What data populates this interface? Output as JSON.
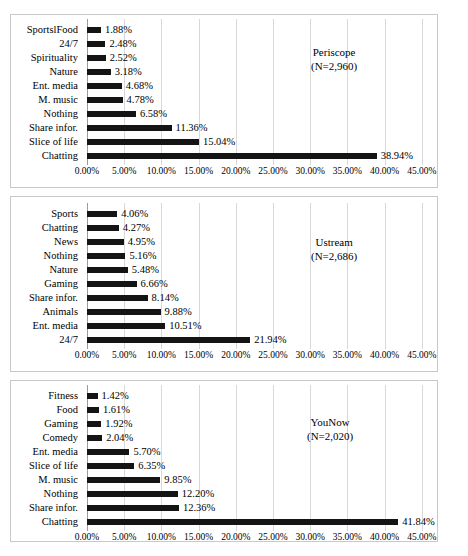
{
  "figure": {
    "background": "#ffffff",
    "frame_color": "#c9c9c9",
    "bar_color": "#141414",
    "gridline_color": "#d8d8d8"
  },
  "chart_data": [
    {
      "type": "bar",
      "orientation": "horizontal",
      "title": "",
      "series_name": "Periscope",
      "sample_size_label": "(N=2,960)",
      "categories": [
        "SportslFood",
        "24/7",
        "Spirituality",
        "Nature",
        "Ent. media",
        "M. music",
        "Nothing",
        "Share infor.",
        "Slice of life",
        "Chatting"
      ],
      "values": [
        1.88,
        2.48,
        2.52,
        3.18,
        4.68,
        4.78,
        6.58,
        11.36,
        15.04,
        38.94
      ],
      "data_labels": [
        "1.88%",
        "2.48%",
        "2.52%",
        "3.18%",
        "4.68%",
        "4.78%",
        "6.58%",
        "11.36%",
        "15.04%",
        "38.94%"
      ],
      "xlabel": "",
      "ylabel": "",
      "xlim": [
        0,
        45
      ],
      "xticks": [
        0,
        5,
        10,
        15,
        20,
        25,
        30,
        35,
        40,
        45
      ],
      "xticklabels": [
        "0.00%",
        "5.00%",
        "10.00%",
        "15.00%",
        "20.00%",
        "25.00%",
        "30.00%",
        "35.00%",
        "40.00%",
        "45.00%"
      ],
      "grid": true,
      "legend": "none"
    },
    {
      "type": "bar",
      "orientation": "horizontal",
      "title": "",
      "series_name": "Ustream",
      "sample_size_label": "(N=2,686)",
      "categories": [
        "Sports",
        "Chatting",
        "News",
        "Nothing",
        "Nature",
        "Gaming",
        "Share infor.",
        "Animals",
        "Ent. media",
        "24/7"
      ],
      "values": [
        4.06,
        4.27,
        4.95,
        5.16,
        5.48,
        6.66,
        8.14,
        9.88,
        10.51,
        21.94
      ],
      "data_labels": [
        "4.06%",
        "4.27%",
        "4.95%",
        "5.16%",
        "5.48%",
        "6.66%",
        "8.14%",
        "9.88%",
        "10.51%",
        "21.94%"
      ],
      "xlabel": "",
      "ylabel": "",
      "xlim": [
        0,
        45
      ],
      "xticks": [
        0,
        5,
        10,
        15,
        20,
        25,
        30,
        35,
        40,
        45
      ],
      "xticklabels": [
        "0.00%",
        "5.00%",
        "10.00%",
        "15.00%",
        "20.00%",
        "25.00%",
        "30.00%",
        "35.00%",
        "40.00%",
        "45.00%"
      ],
      "grid": true,
      "legend": "none"
    },
    {
      "type": "bar",
      "orientation": "horizontal",
      "title": "",
      "series_name": "YouNow",
      "sample_size_label": "(N=2,020)",
      "categories": [
        "Fitness",
        "Food",
        "Gaming",
        "Comedy",
        "Ent. media",
        "Slice of life",
        "M. music",
        "Nothing",
        "Share infor.",
        "Chatting"
      ],
      "values": [
        1.42,
        1.61,
        1.92,
        2.04,
        5.7,
        6.35,
        9.85,
        12.2,
        12.36,
        41.84
      ],
      "data_labels": [
        "1.42%",
        "1.61%",
        "1.92%",
        "2.04%",
        "5.70%",
        "6.35%",
        "9.85%",
        "12.20%",
        "12.36%",
        "41.84%"
      ],
      "xlabel": "",
      "ylabel": "",
      "xlim": [
        0,
        45
      ],
      "xticks": [
        0,
        5,
        10,
        15,
        20,
        25,
        30,
        35,
        40,
        45
      ],
      "xticklabels": [
        "0.00%",
        "5.00%",
        "10.00%",
        "15.00%",
        "20.00%",
        "25.00%",
        "30.00%",
        "35.00%",
        "40.00%",
        "45.00%"
      ],
      "grid": true,
      "legend": "none"
    }
  ]
}
